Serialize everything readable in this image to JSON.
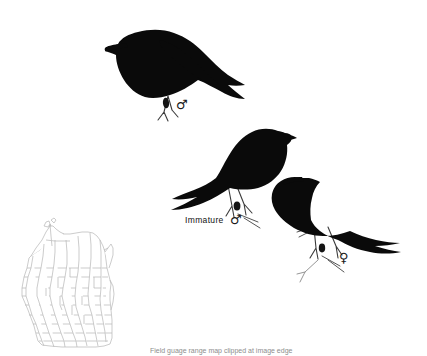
{
  "plate": {
    "background_color": "#ffffff",
    "bird_color": "#0a0a0a",
    "line_color": "#2b2b2b",
    "map_line_color": "#b8b8b8",
    "width": 427,
    "height": 356
  },
  "labels": {
    "immature": "Immature",
    "male_symbol": "♂",
    "female_symbol": "♀"
  },
  "birds": [
    {
      "id": "adult-male",
      "position": "top-left",
      "facing": "left",
      "sex_symbol": "♂",
      "caption": ""
    },
    {
      "id": "immature-male",
      "position": "center",
      "facing": "right",
      "sex_symbol": "♂",
      "caption": "Immature"
    },
    {
      "id": "female",
      "position": "right",
      "facing": "right",
      "sex_symbol": "♀",
      "caption": ""
    }
  ],
  "map": {
    "name": "wisconsin-county-map",
    "position": "bottom-left",
    "outline_color": "#b0b0b0"
  },
  "caption": {
    "text": "Field guage range map clipped at image edge"
  }
}
